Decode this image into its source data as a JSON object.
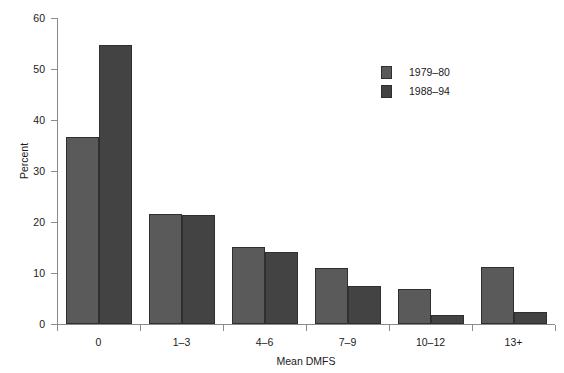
{
  "chart_data": {
    "type": "bar",
    "title": "",
    "xlabel": "Mean DMFS",
    "ylabel": "Percent",
    "categories": [
      "0",
      "1–3",
      "4–6",
      "7–9",
      "10–12",
      "13+"
    ],
    "series": [
      {
        "name": "1979–80",
        "color": "#5a5a5a",
        "values": [
          36.7,
          21.5,
          15.1,
          11.0,
          6.8,
          11.1
        ]
      },
      {
        "name": "1988–94",
        "color": "#434343",
        "values": [
          54.7,
          21.4,
          14.1,
          7.4,
          1.8,
          2.4
        ]
      }
    ],
    "ylim": [
      0,
      60
    ],
    "yticks": [
      0,
      10,
      20,
      30,
      40,
      50,
      60
    ],
    "ytick_labels": [
      "0",
      "10",
      "20",
      "30",
      "40",
      "50",
      "60"
    ],
    "grid": false,
    "legend_position": "upper right",
    "axis_color": "#8a8a8a",
    "bar_edge_color": "#2f2f2f"
  }
}
